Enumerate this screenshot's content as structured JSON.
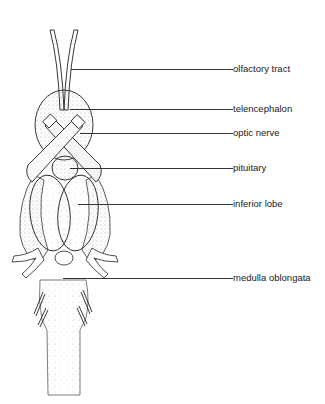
{
  "figure": {
    "colors": {
      "ink": "#1a1a1a",
      "leader": "#333333",
      "background": "#ffffff"
    },
    "labels": [
      {
        "id": "olfactory-tract",
        "text": "olfactory tract",
        "y": 69,
        "line_start_x": 71
      },
      {
        "id": "telencephalon",
        "text": "telencephalon",
        "y": 109,
        "line_start_x": 70
      },
      {
        "id": "optic-nerve",
        "text": "optic nerve",
        "y": 133,
        "line_start_x": 80
      },
      {
        "id": "pituitary",
        "text": "pituitary",
        "y": 168,
        "line_start_x": 70
      },
      {
        "id": "inferior-lobe",
        "text": "inferior lobe",
        "y": 204,
        "line_start_x": 78
      },
      {
        "id": "medulla-oblongata",
        "text": "medulla oblongata",
        "y": 278,
        "line_start_x": 63
      }
    ]
  }
}
